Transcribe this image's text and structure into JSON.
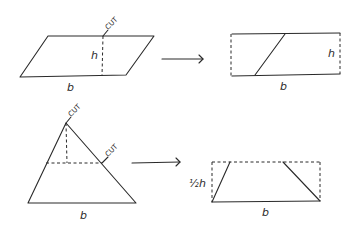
{
  "diagram": {
    "parallelogram": {
      "height_label": "h",
      "base_label": "b",
      "cut_label": "CUT"
    },
    "rectangle": {
      "height_label": "h",
      "base_label": "b"
    },
    "triangle": {
      "base_label": "b",
      "cut_top_label": "CUT",
      "cut_side_label": "CUT"
    },
    "rectangle_from_triangle": {
      "half_label": "½",
      "height_label": "h",
      "base_label": "b"
    }
  }
}
